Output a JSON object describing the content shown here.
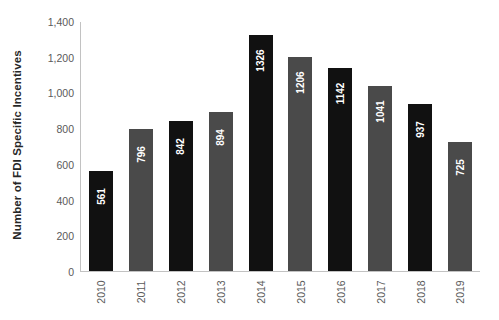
{
  "chart_data": {
    "type": "bar",
    "title": "",
    "xlabel": "",
    "ylabel": "Number of FDI Specific Incentives",
    "categories": [
      "2010",
      "2011",
      "2012",
      "2013",
      "2014",
      "2015",
      "2016",
      "2017",
      "2018",
      "2019"
    ],
    "values": [
      561,
      796,
      842,
      894,
      1326,
      1206,
      1142,
      1041,
      937,
      725
    ],
    "value_labels": [
      "561",
      "796",
      "842",
      "894",
      "1326",
      "1206",
      "1142",
      "1041",
      "937",
      "725"
    ],
    "bar_colors": [
      "#111111",
      "#4a4a4a",
      "#111111",
      "#4a4a4a",
      "#111111",
      "#4a4a4a",
      "#111111",
      "#4a4a4a",
      "#111111",
      "#4a4a4a"
    ],
    "ylim": [
      0,
      1400
    ],
    "yticks": [
      0,
      200,
      400,
      600,
      800,
      1000,
      1200,
      1400
    ],
    "ytick_labels": [
      "0",
      "200",
      "400",
      "600",
      "800",
      "1,000",
      "1,200",
      "1,400"
    ],
    "grid": false,
    "legend": null,
    "label_position": "inside-top",
    "label_color": "#ffffff",
    "label_rotation": -90,
    "xtick_rotation": -90,
    "axis_color": "#c2c2c2",
    "background": "#ffffff"
  }
}
